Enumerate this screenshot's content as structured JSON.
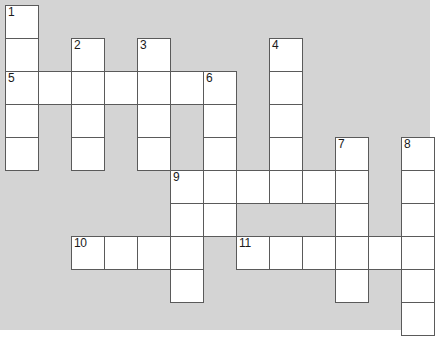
{
  "puzzle": {
    "title": "Crossword Puzzle Grid",
    "kind": "crossword-grid",
    "background_color": "#d4d4d4",
    "cell_color": "#ffffff",
    "cell_border_color": "#5a5a5a",
    "cell_size_px": 33,
    "grid_origin_x_px": 5,
    "grid_origin_y_px": 5,
    "columns": 13,
    "rows": 10,
    "caption": "",
    "cells": [
      {
        "id": "c-r0-c0",
        "col": 0,
        "row": 0,
        "number": "1",
        "letter": ""
      },
      {
        "id": "c-r1-c0",
        "col": 0,
        "row": 1,
        "number": "",
        "letter": ""
      },
      {
        "id": "c-r1-c2",
        "col": 2,
        "row": 1,
        "number": "2",
        "letter": ""
      },
      {
        "id": "c-r1-c4",
        "col": 4,
        "row": 1,
        "number": "3",
        "letter": ""
      },
      {
        "id": "c-r1-c8",
        "col": 8,
        "row": 1,
        "number": "4",
        "letter": ""
      },
      {
        "id": "c-r2-c0",
        "col": 0,
        "row": 2,
        "number": "5",
        "letter": ""
      },
      {
        "id": "c-r2-c1",
        "col": 1,
        "row": 2,
        "number": "",
        "letter": ""
      },
      {
        "id": "c-r2-c2",
        "col": 2,
        "row": 2,
        "number": "",
        "letter": ""
      },
      {
        "id": "c-r2-c3",
        "col": 3,
        "row": 2,
        "number": "",
        "letter": ""
      },
      {
        "id": "c-r2-c4",
        "col": 4,
        "row": 2,
        "number": "",
        "letter": ""
      },
      {
        "id": "c-r2-c5",
        "col": 5,
        "row": 2,
        "number": "",
        "letter": ""
      },
      {
        "id": "c-r2-c6",
        "col": 6,
        "row": 2,
        "number": "6",
        "letter": ""
      },
      {
        "id": "c-r2-c8",
        "col": 8,
        "row": 2,
        "number": "",
        "letter": ""
      },
      {
        "id": "c-r3-c0",
        "col": 0,
        "row": 3,
        "number": "",
        "letter": ""
      },
      {
        "id": "c-r3-c2",
        "col": 2,
        "row": 3,
        "number": "",
        "letter": ""
      },
      {
        "id": "c-r3-c4",
        "col": 4,
        "row": 3,
        "number": "",
        "letter": ""
      },
      {
        "id": "c-r3-c6",
        "col": 6,
        "row": 3,
        "number": "",
        "letter": ""
      },
      {
        "id": "c-r3-c8",
        "col": 8,
        "row": 3,
        "number": "",
        "letter": ""
      },
      {
        "id": "c-r4-c0",
        "col": 0,
        "row": 4,
        "number": "",
        "letter": ""
      },
      {
        "id": "c-r4-c2",
        "col": 2,
        "row": 4,
        "number": "",
        "letter": ""
      },
      {
        "id": "c-r4-c4",
        "col": 4,
        "row": 4,
        "number": "",
        "letter": ""
      },
      {
        "id": "c-r4-c6",
        "col": 6,
        "row": 4,
        "number": "",
        "letter": ""
      },
      {
        "id": "c-r4-c8",
        "col": 8,
        "row": 4,
        "number": "",
        "letter": ""
      },
      {
        "id": "c-r4-c10",
        "col": 10,
        "row": 4,
        "number": "7",
        "letter": ""
      },
      {
        "id": "c-r4-c12",
        "col": 12,
        "row": 4,
        "number": "8",
        "letter": ""
      },
      {
        "id": "c-r5-c5",
        "col": 5,
        "row": 5,
        "number": "9",
        "letter": ""
      },
      {
        "id": "c-r5-c6",
        "col": 6,
        "row": 5,
        "number": "",
        "letter": ""
      },
      {
        "id": "c-r5-c7",
        "col": 7,
        "row": 5,
        "number": "",
        "letter": ""
      },
      {
        "id": "c-r5-c8",
        "col": 8,
        "row": 5,
        "number": "",
        "letter": ""
      },
      {
        "id": "c-r5-c9",
        "col": 9,
        "row": 5,
        "number": "",
        "letter": ""
      },
      {
        "id": "c-r5-c10",
        "col": 10,
        "row": 5,
        "number": "",
        "letter": ""
      },
      {
        "id": "c-r5-c12",
        "col": 12,
        "row": 5,
        "number": "",
        "letter": ""
      },
      {
        "id": "c-r6-c5",
        "col": 5,
        "row": 6,
        "number": "",
        "letter": ""
      },
      {
        "id": "c-r6-c6",
        "col": 6,
        "row": 6,
        "number": "",
        "letter": ""
      },
      {
        "id": "c-r6-c10",
        "col": 10,
        "row": 6,
        "number": "",
        "letter": ""
      },
      {
        "id": "c-r6-c12",
        "col": 12,
        "row": 6,
        "number": "",
        "letter": ""
      },
      {
        "id": "c-r7-c2",
        "col": 2,
        "row": 7,
        "number": "10",
        "letter": ""
      },
      {
        "id": "c-r7-c3",
        "col": 3,
        "row": 7,
        "number": "",
        "letter": ""
      },
      {
        "id": "c-r7-c4",
        "col": 4,
        "row": 7,
        "number": "",
        "letter": ""
      },
      {
        "id": "c-r7-c5",
        "col": 5,
        "row": 7,
        "number": "",
        "letter": ""
      },
      {
        "id": "c-r7-c7",
        "col": 7,
        "row": 7,
        "number": "11",
        "letter": ""
      },
      {
        "id": "c-r7-c8",
        "col": 8,
        "row": 7,
        "number": "",
        "letter": ""
      },
      {
        "id": "c-r7-c9",
        "col": 9,
        "row": 7,
        "number": "",
        "letter": ""
      },
      {
        "id": "c-r7-c10",
        "col": 10,
        "row": 7,
        "number": "",
        "letter": ""
      },
      {
        "id": "c-r7-c11",
        "col": 11,
        "row": 7,
        "number": "",
        "letter": ""
      },
      {
        "id": "c-r7-c12",
        "col": 12,
        "row": 7,
        "number": "",
        "letter": ""
      },
      {
        "id": "c-r8-c5",
        "col": 5,
        "row": 8,
        "number": "",
        "letter": ""
      },
      {
        "id": "c-r8-c10",
        "col": 10,
        "row": 8,
        "number": "",
        "letter": ""
      },
      {
        "id": "c-r8-c12",
        "col": 12,
        "row": 8,
        "number": "",
        "letter": ""
      },
      {
        "id": "c-r9-c12",
        "col": 12,
        "row": 9,
        "number": "",
        "letter": ""
      }
    ]
  }
}
